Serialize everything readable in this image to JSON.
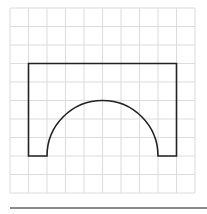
{
  "figure": {
    "grid": {
      "columns": 10,
      "rows": 10,
      "origin_x": 10,
      "origin_y": 8,
      "cell_size": 18.5,
      "line_color": "#dcdcdc"
    },
    "shape": {
      "stroke_color": "#222222",
      "stroke_width": 1.6,
      "outer_top_row": 3,
      "outer_left_col": 1,
      "outer_right_col": 9,
      "base_row": 8,
      "arch_left_col": 2,
      "arch_right_col": 8,
      "arch_radius_cells": 3
    },
    "rule_color": "#8a8a8a"
  }
}
